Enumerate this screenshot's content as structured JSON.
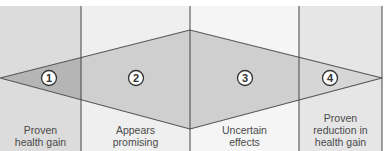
{
  "diagram": {
    "type": "diamond-zones",
    "panels": [
      {
        "id": 1,
        "number": "1",
        "label_line1": "Proven",
        "label_line2": "health gain",
        "label_line3": "",
        "bg": "#dcdcdc"
      },
      {
        "id": 2,
        "number": "2",
        "label_line1": "Appears",
        "label_line2": "promising",
        "label_line3": "",
        "bg": "#efefef"
      },
      {
        "id": 3,
        "number": "3",
        "label_line1": "Uncertain",
        "label_line2": "effects",
        "label_line3": "",
        "bg": "#f5f5f5"
      },
      {
        "id": 4,
        "number": "4",
        "label_line1": "Proven",
        "label_line2": "reduction in",
        "label_line3": "health gain",
        "bg": "#e6e6e6"
      }
    ],
    "colors": {
      "diamond_fill": "#cfcfcf",
      "diamond_dark_fill": "#b5b5b5",
      "outline": "#555555",
      "divider": "#444444",
      "circle_fill": "#ffffff",
      "circle_stroke": "#333333"
    }
  }
}
